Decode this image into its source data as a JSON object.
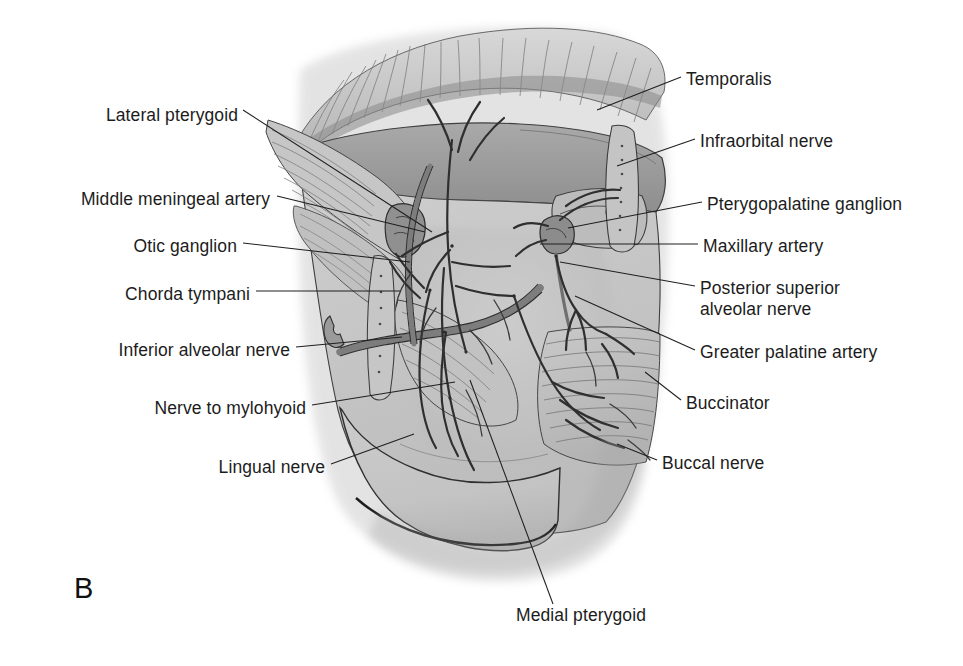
{
  "figure": {
    "panel_letter": "B"
  },
  "labels_left": [
    {
      "id": "lateral-pterygoid",
      "text": "Lateral pterygoid",
      "x": 238,
      "y": 118
    },
    {
      "id": "middle-meningeal-artery",
      "text": "Middle meningeal artery",
      "x": 270,
      "y": 202
    },
    {
      "id": "otic-ganglion",
      "text": "Otic ganglion",
      "x": 237,
      "y": 249
    },
    {
      "id": "chorda-tympani",
      "text": "Chorda tympani",
      "x": 250,
      "y": 297
    },
    {
      "id": "inferior-alveolar-nerve",
      "text": "Inferior alveolar nerve",
      "x": 290,
      "y": 353
    },
    {
      "id": "nerve-to-mylohyoid",
      "text": "Nerve to mylohyoid",
      "x": 306,
      "y": 411
    },
    {
      "id": "lingual-nerve",
      "text": "Lingual nerve",
      "x": 325,
      "y": 470
    }
  ],
  "labels_right": [
    {
      "id": "temporalis",
      "text": "Temporalis",
      "x": 686,
      "y": 82
    },
    {
      "id": "infraorbital-nerve",
      "text": "Infraorbital nerve",
      "x": 700,
      "y": 144
    },
    {
      "id": "pterygopalatine-ganglion",
      "text": "Pterygopalatine ganglion",
      "x": 707,
      "y": 207
    },
    {
      "id": "maxillary-artery",
      "text": "Maxillary artery",
      "x": 703,
      "y": 249
    },
    {
      "id": "posterior-superior-alveolar-nerve",
      "text": "Posterior superior\nalveolar nerve",
      "x": 700,
      "y": 291
    },
    {
      "id": "greater-palatine-artery",
      "text": "Greater palatine artery",
      "x": 700,
      "y": 355
    },
    {
      "id": "buccinator",
      "text": "Buccinator",
      "x": 686,
      "y": 406
    },
    {
      "id": "buccal-nerve",
      "text": "Buccal nerve",
      "x": 662,
      "y": 466
    }
  ],
  "labels_bottom": [
    {
      "id": "medial-pterygoid",
      "text": "Medial pterygoid",
      "x": 516,
      "y": 618
    }
  ],
  "leaders": [
    {
      "id": "leader-lateral-pterygoid",
      "d": "M 243,110 L 432,232"
    },
    {
      "id": "leader-middle-meningeal-artery",
      "d": "M 277,196 L 425,232"
    },
    {
      "id": "leader-otic-ganglion",
      "d": "M 243,243 L 410,262"
    },
    {
      "id": "leader-chorda-tympani",
      "d": "M 256,291 L 400,291"
    },
    {
      "id": "leader-inferior-alveolar-nerve",
      "d": "M 296,347 L 402,337"
    },
    {
      "id": "leader-nerve-to-mylohyoid",
      "d": "M 312,405 L 455,382"
    },
    {
      "id": "leader-lingual-nerve",
      "d": "M 331,464 L 414,434"
    },
    {
      "id": "leader-temporalis",
      "d": "M 681,77 L 597,110"
    },
    {
      "id": "leader-infraorbital-nerve",
      "d": "M 695,139 L 617,166"
    },
    {
      "id": "leader-pterygopalatine-ganglion",
      "d": "M 702,202 L 568,228"
    },
    {
      "id": "leader-maxillary-artery",
      "d": "M 698,244 L 540,244"
    },
    {
      "id": "leader-posterior-superior-alveolar-nerve",
      "d": "M 695,286 L 560,262"
    },
    {
      "id": "leader-greater-palatine-artery",
      "d": "M 695,350 L 575,296"
    },
    {
      "id": "leader-buccinator",
      "d": "M 681,400 L 645,372"
    },
    {
      "id": "leader-buccal-nerve",
      "d": "M 657,460 L 617,444"
    },
    {
      "id": "leader-medial-pterygoid",
      "d": "M 553,604 L 470,380"
    }
  ],
  "colors": {
    "background": "#ffffff",
    "text": "#1c1c1c",
    "leader_line": "#1f1f1f",
    "tissue_light": "#d2d2d2",
    "tissue_mid": "#bdbdbd",
    "tissue_dark": "#a3a3a3",
    "vessel": "#8d8d8d",
    "outline": "#3a3a3a",
    "deep_shadow": "#6f6f6f"
  }
}
